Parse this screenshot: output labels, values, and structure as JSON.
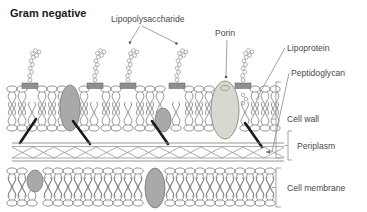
{
  "title": "Gram negative",
  "labels": {
    "lipopolysaccharide": "Lipopolysaccharide",
    "porin": "Porin",
    "lipoprotein": "Lipoprotein",
    "peptidoglycan": "Peptidoglycan",
    "cell_wall": "Cell wall",
    "periplasm": "Periplasm",
    "cell_membrane": "Cell membrane"
  },
  "colors": {
    "title": "#1a1a1a",
    "label_text": "#4a4a4a",
    "line": "#8a8a8a",
    "membrane_outline": "#7d7d7d",
    "protein_fill": "#a9a9a9",
    "protein_outline": "#777777",
    "porin_fill": "#d8d8d0",
    "porin_outline": "#8a8a8a",
    "lps_anchor": "#8f8f8f",
    "lps_chain": "#9a9a9a",
    "arrow_dark": "#1a1a1a",
    "peptidoglycan_mesh": "#8a8a8a",
    "bracket": "#9a9a9a"
  },
  "structure": {
    "outer_membrane": {
      "lps_anchor_x": [
        30,
        95,
        128,
        177,
        243
      ],
      "protein_ellipse_x": [
        70,
        163
      ],
      "porin_x": 225,
      "top_y": 86,
      "bottom_y": 131
    },
    "peptidoglycan_layer": {
      "top_y": 143,
      "bottom_y": 160,
      "mesh_diamonds": 13
    },
    "inner_membrane": {
      "protein_ellipse_x": [
        35,
        155
      ],
      "top_y": 168,
      "bottom_y": 206
    },
    "anchor_arrows": [
      {
        "from_x": 36,
        "from_y": 120,
        "to_x": 20,
        "to_y": 143
      },
      {
        "from_x": 90,
        "from_y": 143,
        "to_x": 73,
        "to_y": 122
      },
      {
        "from_x": 168,
        "from_y": 143,
        "to_x": 152,
        "to_y": 122
      },
      {
        "from_x": 262,
        "from_y": 146,
        "to_x": 245,
        "to_y": 124
      }
    ]
  }
}
